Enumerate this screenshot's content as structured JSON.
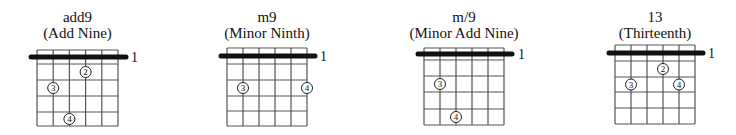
{
  "diagram": {
    "type": "guitar-chord-chart",
    "strings": 6,
    "frets_shown": 5,
    "colors": {
      "line": "#555555",
      "barre": "#111111",
      "dot_fill": "#ffffff",
      "dot_stroke": "#222222",
      "text": "#111111"
    },
    "chords": [
      {
        "name": "add9",
        "description": "(Add Nine)",
        "barre_fret_label": "1",
        "layout": {
          "left": 37,
          "right": 118,
          "top": 50,
          "barre_y": 57,
          "fret_lines": [
            64,
            80,
            96,
            112,
            126
          ],
          "label_x": 131
        },
        "fingers": [
          {
            "number": "2",
            "string": 4,
            "fret": 2
          },
          {
            "number": "3",
            "string": 2,
            "fret": 3
          },
          {
            "number": "4",
            "string": 3,
            "fret": 5
          }
        ]
      },
      {
        "name": "m9",
        "description": "(Minor Ninth)",
        "barre_fret_label": "1",
        "layout": {
          "left": 227,
          "right": 307,
          "top": 48,
          "barre_y": 56,
          "fret_lines": [
            64,
            80,
            96,
            111,
            126
          ],
          "label_x": 320
        },
        "fingers": [
          {
            "number": "3",
            "string": 2,
            "fret": 3
          },
          {
            "number": "4",
            "string": 6,
            "fret": 3
          }
        ]
      },
      {
        "name": "m/9",
        "description": "(Minor Add Nine)",
        "barre_fret_label": "1",
        "layout": {
          "left": 424,
          "right": 504,
          "top": 48,
          "barre_y": 54,
          "fret_lines": [
            60,
            76,
            92,
            109,
            125
          ],
          "label_x": 518
        },
        "fingers": [
          {
            "number": "3",
            "string": 2,
            "fret": 3
          },
          {
            "number": "4",
            "string": 3,
            "fret": 5
          }
        ]
      },
      {
        "name": "13",
        "description": "(Thirteenth)",
        "barre_fret_label": "1",
        "layout": {
          "left": 615,
          "right": 695,
          "top": 45,
          "barre_y": 53,
          "fret_lines": [
            61,
            77,
            92,
            108,
            124
          ],
          "label_x": 708
        },
        "fingers": [
          {
            "number": "2",
            "string": 4,
            "fret": 2
          },
          {
            "number": "3",
            "string": 2,
            "fret": 3
          },
          {
            "number": "4",
            "string": 5,
            "fret": 3
          }
        ]
      }
    ]
  }
}
